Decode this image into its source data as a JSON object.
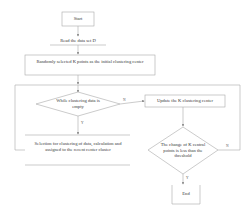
{
  "diagram": {
    "type": "flowchart",
    "nodes": [
      {
        "id": "start",
        "shape": "box",
        "label": "Start"
      },
      {
        "id": "read",
        "shape": "text",
        "label": "Read the data set D"
      },
      {
        "id": "init",
        "shape": "box",
        "label": "Randomly selected K points as the initial clustering center"
      },
      {
        "id": "cond1",
        "shape": "diamond",
        "label": "While clustering data is empty"
      },
      {
        "id": "update",
        "shape": "box",
        "label": "Update the K clustering center"
      },
      {
        "id": "assign",
        "shape": "box",
        "label": "Selection for clustering of data, calculation and assigned to the recent center cluster"
      },
      {
        "id": "cond2",
        "shape": "diamond",
        "label": "The change of K central points is less than the threshold"
      },
      {
        "id": "end",
        "shape": "box",
        "label": "End"
      }
    ],
    "edges": [
      {
        "from": "start",
        "to": "read",
        "label": ""
      },
      {
        "from": "read",
        "to": "init",
        "label": ""
      },
      {
        "from": "init",
        "to": "cond1",
        "label": ""
      },
      {
        "from": "cond1",
        "to": "update",
        "label": "N"
      },
      {
        "from": "cond1",
        "to": "assign",
        "label": "Y"
      },
      {
        "from": "assign",
        "to": "cond1",
        "label": ""
      },
      {
        "from": "update",
        "to": "cond2",
        "label": ""
      },
      {
        "from": "cond2",
        "to": "end",
        "label": "Y"
      },
      {
        "from": "cond2",
        "to": "cond1",
        "label": "N"
      }
    ],
    "edge_labels": {
      "cond1_no": "N",
      "cond1_yes": "Y",
      "cond2_yes": "Y",
      "cond2_no": "N"
    },
    "colors": {
      "line": "#9a9a9a",
      "text": "#3a3a3a",
      "background": "#ffffff"
    }
  }
}
